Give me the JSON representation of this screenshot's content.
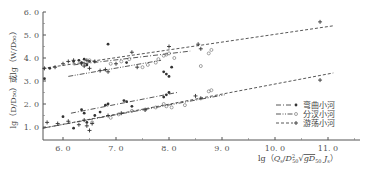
{
  "chart_data": {
    "type": "scatter",
    "title": "",
    "xlabel": "lg (Q_s/D_50^2 √(g D_50 J_s))",
    "ylabel": "lg (D/D_50) 或lg (W/D_50)",
    "xlim": [
      5.62,
      11.6
    ],
    "ylim": [
      0.45,
      6.0
    ],
    "x_ticks": [
      "6.0",
      "7.0",
      "8.0",
      "9.0",
      "10.0",
      "11.0"
    ],
    "y_ticks": [
      "1.0",
      "2.0",
      "3.0",
      "4.0",
      "5.0",
      "6.0"
    ],
    "grid": false,
    "legend_position": "lower right",
    "legend": [
      {
        "label": "弯曲小河",
        "line_style": "dash-dot",
        "marker": "filled-dot"
      },
      {
        "label": "分汊小河",
        "line_style": "dash-dot-dot",
        "marker": "open-circle"
      },
      {
        "label": "游荡小河",
        "line_style": "dashed",
        "marker": "plus"
      }
    ],
    "fit_lines": [
      {
        "group": "upper (W/D50)",
        "series": "游荡小河",
        "style": "dashed",
        "x": [
          5.62,
          11.1
        ],
        "y": [
          3.55,
          5.4
        ]
      },
      {
        "group": "upper (W/D50)",
        "series": "弯曲小河",
        "style": "dash-dot",
        "x": [
          6.2,
          8.4
        ],
        "y": [
          3.7,
          4.3
        ]
      },
      {
        "group": "upper (W/D50)",
        "series": "分汊小河",
        "style": "dash-dot-dot",
        "x": [
          6.1,
          7.85
        ],
        "y": [
          3.2,
          3.9
        ]
      },
      {
        "group": "lower (D/D50)",
        "series": "游荡小河",
        "style": "dashed",
        "x": [
          5.62,
          11.1
        ],
        "y": [
          0.95,
          3.35
        ]
      },
      {
        "group": "lower (D/D50)",
        "series": "弯曲小河",
        "style": "dash-dot",
        "x": [
          6.15,
          8.15
        ],
        "y": [
          1.6,
          2.5
        ]
      },
      {
        "group": "lower (D/D50)",
        "series": "分汊小河",
        "style": "dash-dot-dot",
        "x": [
          5.62,
          9.05
        ],
        "y": [
          0.95,
          2.4
        ]
      }
    ],
    "series": [
      {
        "name": "弯曲小河",
        "marker": "filled-dot",
        "points": [
          [
            5.75,
            3.55
          ],
          [
            6.2,
            3.85
          ],
          [
            6.3,
            3.9
          ],
          [
            6.35,
            3.8
          ],
          [
            6.4,
            3.95
          ],
          [
            6.45,
            3.7
          ],
          [
            6.5,
            3.85
          ],
          [
            6.85,
            4.6
          ],
          [
            7.2,
            3.8
          ],
          [
            7.9,
            3.4
          ],
          [
            7.95,
            3.3
          ],
          [
            8.0,
            3.2
          ],
          [
            8.05,
            3.6
          ],
          [
            5.65,
            3.1
          ],
          [
            6.0,
            1.45
          ],
          [
            6.35,
            1.75
          ],
          [
            6.4,
            1.6
          ],
          [
            6.6,
            1.5
          ],
          [
            6.7,
            1.65
          ],
          [
            6.8,
            1.95
          ],
          [
            6.85,
            2.0
          ],
          [
            7.15,
            2.15
          ],
          [
            7.2,
            2.1
          ],
          [
            7.3,
            1.9
          ],
          [
            7.9,
            2.3
          ],
          [
            7.95,
            2.4
          ],
          [
            8.0,
            2.5
          ],
          [
            6.2,
            0.95
          ],
          [
            6.45,
            1.2
          ]
        ]
      },
      {
        "name": "分汊小河",
        "marker": "open-circle",
        "points": [
          [
            6.5,
            3.9
          ],
          [
            6.9,
            3.75
          ],
          [
            7.1,
            3.85
          ],
          [
            7.25,
            3.95
          ],
          [
            7.5,
            3.6
          ],
          [
            7.6,
            3.7
          ],
          [
            7.75,
            3.8
          ],
          [
            7.8,
            3.95
          ],
          [
            7.9,
            4.1
          ],
          [
            7.95,
            4.15
          ],
          [
            8.0,
            4.2
          ],
          [
            8.1,
            4.0
          ],
          [
            8.6,
            3.65
          ],
          [
            8.75,
            4.2
          ],
          [
            8.8,
            4.35
          ],
          [
            6.55,
            1.2
          ],
          [
            6.9,
            1.4
          ],
          [
            7.05,
            1.55
          ],
          [
            7.3,
            1.7
          ],
          [
            7.55,
            1.75
          ],
          [
            7.75,
            1.85
          ],
          [
            7.9,
            2.0
          ],
          [
            7.95,
            1.9
          ],
          [
            8.05,
            1.85
          ],
          [
            8.3,
            1.95
          ],
          [
            8.8,
            2.6
          ],
          [
            8.75,
            2.55
          ]
        ]
      },
      {
        "name": "游荡小河",
        "marker": "plus",
        "points": [
          [
            5.65,
            3.55
          ],
          [
            5.85,
            3.6
          ],
          [
            6.0,
            3.75
          ],
          [
            6.1,
            3.85
          ],
          [
            6.2,
            3.9
          ],
          [
            6.35,
            3.75
          ],
          [
            6.4,
            3.65
          ],
          [
            6.45,
            3.9
          ],
          [
            6.5,
            3.55
          ],
          [
            6.6,
            3.85
          ],
          [
            6.7,
            3.45
          ],
          [
            6.8,
            3.5
          ],
          [
            6.85,
            3.4
          ],
          [
            7.0,
            3.75
          ],
          [
            7.3,
            4.25
          ],
          [
            7.4,
            3.6
          ],
          [
            8.0,
            4.5
          ],
          [
            8.55,
            4.6
          ],
          [
            8.6,
            4.4
          ],
          [
            10.85,
            5.57
          ],
          [
            5.7,
            1.2
          ],
          [
            5.9,
            1.15
          ],
          [
            6.1,
            1.25
          ],
          [
            6.3,
            1.1
          ],
          [
            6.4,
            1.3
          ],
          [
            6.45,
            1.05
          ],
          [
            6.5,
            0.85
          ],
          [
            6.55,
            1.15
          ],
          [
            6.85,
            1.5
          ],
          [
            7.1,
            1.6
          ],
          [
            7.55,
            1.75
          ],
          [
            8.5,
            2.35
          ],
          [
            8.6,
            2.25
          ],
          [
            10.85,
            3.04
          ]
        ]
      }
    ]
  },
  "plot_area": {
    "x0": 43,
    "x_per_unit": 53,
    "x_origin_value": 6.0,
    "x_origin_px": 63,
    "y_origin_value": 1.0,
    "y_origin_px": 127,
    "y_per_unit": 23,
    "axis_bottom_px": 140,
    "axis_top_px": 12,
    "axis_right_px": 360
  },
  "labels": {
    "y_axis": "lg（D/D₅₀）或lg（W/D₅₀）",
    "x_axis_prefix": "lg（",
    "x_axis_body": "Q",
    "x_axis_suffix": "）"
  }
}
